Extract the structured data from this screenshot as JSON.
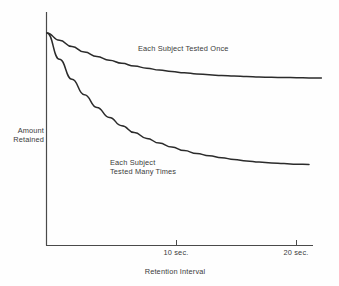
{
  "chart_data": {
    "type": "line",
    "title": "",
    "xlabel": "Retention Interval",
    "ylabel_line1": "Amount",
    "ylabel_line2": "Retained",
    "xlim": [
      0,
      23
    ],
    "ylim": [
      0,
      1
    ],
    "grid": false,
    "legend_position": "inline-annotation",
    "x_tick_values": [
      10,
      20
    ],
    "x_tick_labels": [
      "10 sec.",
      "20 sec."
    ],
    "y_tick_labels": [],
    "axis_color": "#4a4a4a",
    "curve_color": "#2b2b2b",
    "text_color": "#3a3a3a",
    "background_color": "#fefefe",
    "series": [
      {
        "name": "Each Subject Tested Once",
        "label_line1": "Each Subject Tested Once",
        "label_line2": "",
        "x": [
          0,
          1,
          2,
          3,
          4,
          5,
          6,
          7,
          8,
          9,
          10,
          11,
          12,
          13,
          14,
          15,
          16,
          17,
          18,
          19,
          20,
          21,
          22
        ],
        "values": [
          1.0,
          0.96,
          0.925,
          0.895,
          0.87,
          0.85,
          0.833,
          0.818,
          0.806,
          0.796,
          0.788,
          0.781,
          0.775,
          0.77,
          0.766,
          0.763,
          0.76,
          0.758,
          0.756,
          0.755,
          0.754,
          0.753,
          0.752
        ]
      },
      {
        "name": "Each Subject Tested Many Times",
        "label_line1": "Each Subject",
        "label_line2": "Tested Many Times",
        "x": [
          0,
          1,
          2,
          3,
          4,
          5,
          6,
          7,
          8,
          9,
          10,
          11,
          12,
          13,
          14,
          15,
          16,
          17,
          18,
          19,
          20,
          21
        ],
        "values": [
          1.0,
          0.855,
          0.745,
          0.66,
          0.59,
          0.535,
          0.49,
          0.452,
          0.42,
          0.394,
          0.372,
          0.353,
          0.337,
          0.324,
          0.313,
          0.304,
          0.296,
          0.29,
          0.285,
          0.281,
          0.278,
          0.276
        ]
      }
    ]
  },
  "annotations": {
    "upper_curve_label": "Each Subject Tested Once",
    "lower_curve_label_line1": "Each Subject",
    "lower_curve_label_line2": "Tested Many Times"
  },
  "axes": {
    "y_title_line1": "Amount",
    "y_title_line2": "Retained",
    "x_title": "Retention Interval",
    "tick_0": "10 sec.",
    "tick_1": "20 sec."
  }
}
